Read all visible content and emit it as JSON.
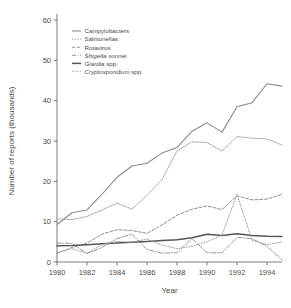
{
  "chart_data": {
    "type": "line",
    "title": "",
    "xlabel": "Year",
    "ylabel": "Number of reports (thousands)",
    "xlim": [
      1980,
      1995
    ],
    "ylim": [
      0,
      60
    ],
    "xticks": [
      1980,
      1982,
      1984,
      1986,
      1988,
      1990,
      1992,
      1994
    ],
    "yticks": [
      0,
      10,
      20,
      30,
      40,
      50,
      60
    ],
    "xtick_labels": [
      "1980",
      "1982",
      "1984",
      "1986",
      "1988",
      "1990",
      "1992",
      "1994"
    ],
    "ytick_labels": [
      "0",
      "10",
      "20",
      "30",
      "40",
      "50",
      "60"
    ],
    "grid": false,
    "legend_position": "upper left",
    "x": [
      1980,
      1981,
      1982,
      1983,
      1984,
      1985,
      1986,
      1987,
      1988,
      1989,
      1990,
      1991,
      1992,
      1993,
      1994,
      1995
    ],
    "series": [
      {
        "name": "Campylobacters",
        "style": "solid",
        "color": "#8a8a8a",
        "width": 1.1,
        "values": [
          9.3,
          12.2,
          12.9,
          16.8,
          21.0,
          23.8,
          24.5,
          27.0,
          28.4,
          32.4,
          34.5,
          32.2,
          38.5,
          39.5,
          44.2,
          43.6
        ]
      },
      {
        "name": "Salmonellas",
        "style": "dotted",
        "color": "#9a9a9a",
        "width": 1.0,
        "values": [
          10.7,
          10.5,
          11.3,
          12.9,
          14.6,
          13.1,
          16.5,
          20.5,
          27.5,
          29.8,
          29.6,
          27.5,
          31.1,
          30.7,
          30.5,
          29.0
        ]
      },
      {
        "name": "Rotavirus",
        "style": "dashed",
        "color": "#8f8f8f",
        "width": 1.0,
        "values": [
          2.1,
          3.6,
          4.7,
          6.9,
          8.0,
          7.8,
          7.1,
          9.2,
          11.6,
          13.1,
          13.9,
          13.0,
          16.4,
          15.4,
          15.6,
          16.8
        ]
      },
      {
        "name": "Shigella sonnei",
        "style": "dash-dot",
        "color": "#979797",
        "width": 1.0,
        "values": [
          4.7,
          4.6,
          2.1,
          3.6,
          5.8,
          6.9,
          3.1,
          2.2,
          2.3,
          5.8,
          2.3,
          2.3,
          6.1,
          5.8,
          3.9,
          0.5
        ]
      },
      {
        "name": "Giardia spp.",
        "style": "solid",
        "color": "#555555",
        "width": 1.5,
        "values": [
          4.0,
          4.1,
          4.3,
          4.5,
          4.7,
          4.9,
          5.1,
          5.3,
          5.5,
          6.0,
          6.9,
          6.6,
          7.0,
          6.6,
          6.4,
          6.3
        ]
      },
      {
        "name": "Cryptosporidium spp.",
        "style": "dotted-sparse",
        "color": "#a0a0a0",
        "width": 1.0,
        "values": [
          2.3,
          3.3,
          2.2,
          4.3,
          5.1,
          4.9,
          5.7,
          4.2,
          3.3,
          3.9,
          5.0,
          6.7,
          16.8,
          5.4,
          4.3,
          5.0
        ]
      }
    ]
  },
  "legend": {
    "items": [
      {
        "label": "Campylobacters",
        "italic_part": "",
        "plain_part": "Campylobacters"
      },
      {
        "label": "Salmonellas",
        "italic_part": "",
        "plain_part": "Salmonellas"
      },
      {
        "label": "Rotavirus",
        "italic_part": "",
        "plain_part": "Rotavirus"
      },
      {
        "label": "Shigella sonnei",
        "italic_part": "Shigella sonnei",
        "plain_part": ""
      },
      {
        "label": "Giardia spp.",
        "italic_part": "Giardia",
        "plain_part": " spp."
      },
      {
        "label": "Cryptosporidium spp.",
        "italic_part": "Cryptosporidium",
        "plain_part": " spp."
      }
    ]
  },
  "colors": {
    "background": "#ffffff",
    "axis": "#5a5a5a",
    "text": "#4a4a4a"
  }
}
